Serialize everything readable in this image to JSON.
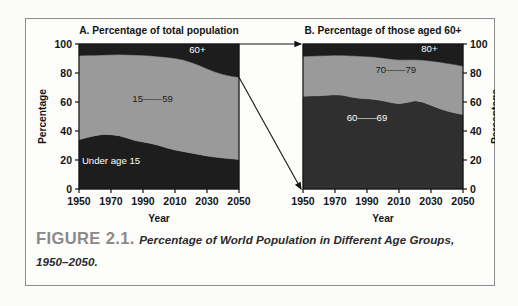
{
  "figure": {
    "caption_head": "FIGURE 2.1.",
    "caption_body": "Percentage of World Population in Different Age Groups, 1950–2050."
  },
  "colors": {
    "dark_band": "#1d1d1d",
    "mid_band": "#2f2f2f",
    "light_band": "#9a9a9a",
    "axis": "#141414",
    "page": "#fbfbf9",
    "frame": "#8d8d8d",
    "caption_head": "#8a8a8a",
    "caption_body": "#2a2a2a",
    "label_light": "#ffffff",
    "label_dark": "#202020"
  },
  "chart_data": [
    {
      "id": "panel-a",
      "type": "area",
      "stacked": true,
      "title": "A. Percentage of total population",
      "xlabel": "Year",
      "ylabel": "Percentage",
      "xlim": [
        1950,
        2050
      ],
      "ylim": [
        0,
        100
      ],
      "xticks": [
        1950,
        1970,
        1990,
        2010,
        2030,
        2050
      ],
      "yticks": [
        0,
        20,
        40,
        60,
        80,
        100
      ],
      "ytick_side": "left",
      "grid": false,
      "legend": "inline-labels",
      "x": [
        1950,
        1955,
        1960,
        1965,
        1970,
        1975,
        1980,
        1985,
        1990,
        1995,
        2000,
        2005,
        2010,
        2015,
        2020,
        2025,
        2030,
        2035,
        2040,
        2045,
        2050
      ],
      "series": [
        {
          "name": "Under age 15",
          "label": "Under age 15",
          "label_color": "#ffffff",
          "color": "#1d1d1d",
          "values": [
            34.0,
            35.5,
            36.8,
            37.6,
            37.5,
            36.8,
            35.2,
            33.4,
            32.4,
            31.4,
            30.0,
            28.3,
            26.9,
            25.8,
            24.8,
            23.8,
            22.8,
            22.0,
            21.4,
            20.9,
            20.4
          ]
        },
        {
          "name": "15—59",
          "label": "15——59",
          "label_color": "#202020",
          "color": "#9a9a9a",
          "values": [
            58.0,
            56.7,
            55.5,
            54.9,
            55.1,
            55.9,
            57.4,
            59.1,
            59.9,
            60.5,
            61.4,
            62.6,
            63.3,
            63.3,
            62.7,
            61.6,
            60.2,
            58.8,
            57.7,
            57.0,
            56.6
          ]
        },
        {
          "name": "60+",
          "label": "60+",
          "label_color": "#ffffff",
          "color": "#1d1d1d",
          "values": [
            8.0,
            7.8,
            7.7,
            7.5,
            7.4,
            7.3,
            7.4,
            7.5,
            7.7,
            8.1,
            8.6,
            9.1,
            9.8,
            10.9,
            12.5,
            14.6,
            17.0,
            19.2,
            20.9,
            22.1,
            23.0
          ]
        }
      ],
      "annotations": [
        {
          "text": "60+",
          "x_frac": 0.74,
          "y_frac": 0.94,
          "color": "#ffffff"
        },
        {
          "text": "15——59",
          "x_frac": 0.46,
          "y_frac": 0.6,
          "color": "#202020"
        },
        {
          "text": "Under age 15",
          "x_frac": 0.2,
          "y_frac": 0.17,
          "color": "#ffffff"
        }
      ]
    },
    {
      "id": "panel-b",
      "type": "area",
      "stacked": true,
      "title": "B. Percentage of those aged 60+",
      "xlabel": "Year",
      "ylabel": "Percentage",
      "xlim": [
        1950,
        2050
      ],
      "ylim": [
        0,
        100
      ],
      "xticks": [
        1950,
        1970,
        1990,
        2010,
        2030,
        2050
      ],
      "yticks": [
        0,
        20,
        40,
        60,
        80,
        100
      ],
      "ytick_side": "right",
      "grid": false,
      "legend": "inline-labels",
      "x": [
        1950,
        1955,
        1960,
        1965,
        1970,
        1975,
        1980,
        1985,
        1990,
        1995,
        2000,
        2005,
        2010,
        2015,
        2020,
        2025,
        2030,
        2035,
        2040,
        2045,
        2050
      ],
      "series": [
        {
          "name": "60—69",
          "label": "60——69",
          "label_color": "#ffffff",
          "color": "#2f2f2f",
          "values": [
            64.0,
            64.2,
            64.3,
            64.6,
            65.0,
            64.6,
            63.4,
            62.6,
            62.3,
            61.8,
            60.8,
            59.6,
            58.8,
            59.6,
            60.8,
            59.9,
            57.7,
            55.6,
            53.8,
            52.4,
            51.4
          ]
        },
        {
          "name": "70—79",
          "label": "70——79",
          "label_color": "#202020",
          "color": "#9a9a9a",
          "values": [
            27.5,
            27.5,
            27.6,
            27.5,
            27.3,
            27.6,
            28.5,
            29.1,
            29.1,
            29.2,
            29.6,
            30.1,
            30.3,
            29.5,
            28.4,
            29.0,
            30.6,
            32.0,
            32.9,
            33.4,
            33.4
          ]
        },
        {
          "name": "80+",
          "label": "80+",
          "label_color": "#ffffff",
          "color": "#1d1d1d",
          "values": [
            8.5,
            8.3,
            8.1,
            7.9,
            7.7,
            7.8,
            8.1,
            8.3,
            8.6,
            9.0,
            9.6,
            10.3,
            10.9,
            10.9,
            10.8,
            11.1,
            11.7,
            12.4,
            13.3,
            14.2,
            15.2
          ]
        }
      ],
      "annotations": [
        {
          "text": "80+",
          "x_frac": 0.79,
          "y_frac": 0.945,
          "color": "#ffffff"
        },
        {
          "text": "70——79",
          "x_frac": 0.58,
          "y_frac": 0.8,
          "color": "#202020"
        },
        {
          "text": "60——69",
          "x_frac": 0.4,
          "y_frac": 0.47,
          "color": "#ffffff"
        }
      ]
    }
  ],
  "connectors": [
    {
      "name": "top-connector",
      "from": "panel-a top-right (100%)",
      "to": "panel-b top-left (100%)"
    },
    {
      "name": "diagonal-connector",
      "from": "panel-a right edge at 77%",
      "to": "panel-b bottom-left (0%)"
    }
  ]
}
